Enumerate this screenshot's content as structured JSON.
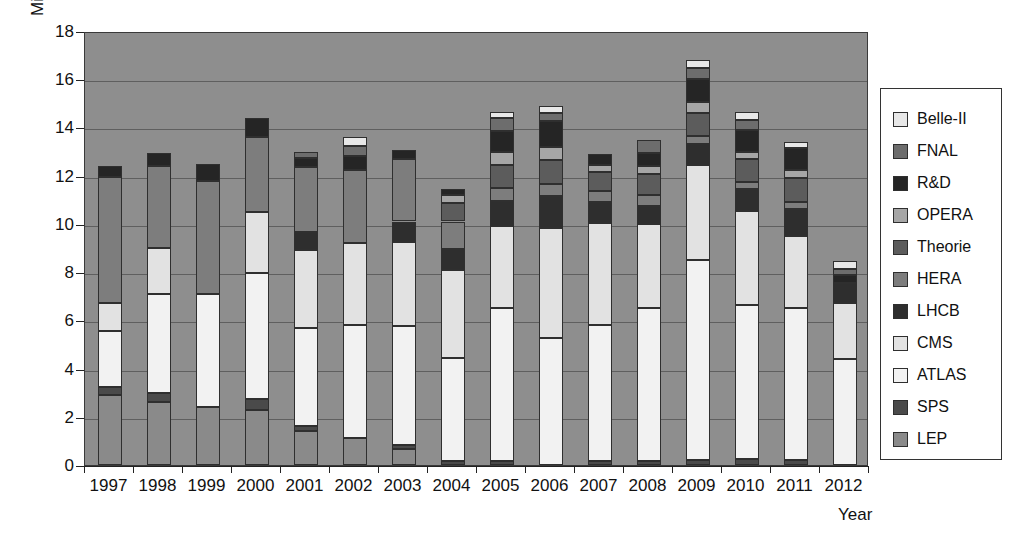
{
  "chart_data": {
    "type": "bar",
    "title": "",
    "subtitle": "",
    "stacked": true,
    "ylabel": "Mill. €",
    "xlabel": "Year",
    "ylim": [
      0,
      18
    ],
    "ytick_values": [
      0,
      2,
      4,
      6,
      8,
      10,
      12,
      14,
      16,
      18
    ],
    "ytick_labels": [
      "0",
      "2",
      "4",
      "6",
      "8",
      "10",
      "12",
      "14",
      "16",
      "18"
    ],
    "grid": true,
    "grid_axis": "y",
    "legend_position": "right",
    "categories": [
      "1997",
      "1998",
      "1999",
      "2000",
      "2001",
      "2002",
      "2003",
      "2004",
      "2005",
      "2006",
      "2007",
      "2008",
      "2009",
      "2010",
      "2011",
      "2012"
    ],
    "series": [
      {
        "name": "LEP",
        "color": "#8a8a8a",
        "values": [
          2.9,
          2.6,
          2.4,
          2.3,
          1.4,
          1.1,
          0.65,
          0.0,
          0.0,
          0.0,
          0.0,
          0.0,
          0.0,
          0.0,
          0.0,
          0.0
        ]
      },
      {
        "name": "SPS",
        "color": "#4a4a4a",
        "values": [
          0.35,
          0.4,
          0.0,
          0.45,
          0.2,
          0.0,
          0.2,
          0.15,
          0.15,
          0.0,
          0.15,
          0.15,
          0.2,
          0.25,
          0.2,
          0.0
        ]
      },
      {
        "name": "ATLAS",
        "color": "#f2f2f2",
        "values": [
          2.3,
          4.1,
          4.7,
          5.2,
          4.1,
          4.7,
          4.9,
          4.3,
          6.35,
          5.25,
          5.65,
          6.35,
          8.3,
          6.4,
          6.3,
          4.4
        ]
      },
      {
        "name": "CMS",
        "color": "#e2e2e2",
        "values": [
          1.15,
          1.9,
          0.0,
          2.55,
          3.2,
          3.4,
          3.5,
          3.65,
          3.4,
          4.6,
          4.25,
          3.5,
          3.95,
          3.9,
          3.0,
          2.3
        ]
      },
      {
        "name": "LHCB",
        "color": "#2e2e2e",
        "values": [
          0.0,
          0.0,
          0.0,
          0.0,
          0.75,
          0.0,
          0.85,
          0.85,
          1.05,
          1.3,
          0.85,
          0.75,
          0.85,
          0.9,
          1.1,
          0.85
        ]
      },
      {
        "name": "HERA",
        "color": "#7d7d7d",
        "values": [
          5.25,
          3.4,
          4.7,
          3.1,
          2.7,
          3.05,
          2.6,
          1.15,
          0.55,
          0.5,
          0.45,
          0.45,
          0.35,
          0.3,
          0.3,
          0.0
        ]
      },
      {
        "name": "Theorie",
        "color": "#5c5c5c",
        "values": [
          0.0,
          0.0,
          0.0,
          0.0,
          0.0,
          0.0,
          0.0,
          0.75,
          0.95,
          1.0,
          0.8,
          0.85,
          0.95,
          0.95,
          1.0,
          0.0
        ]
      },
      {
        "name": "OPERA",
        "color": "#a6a6a6",
        "values": [
          0.0,
          0.0,
          0.0,
          0.0,
          0.0,
          0.0,
          0.0,
          0.35,
          0.55,
          0.55,
          0.3,
          0.35,
          0.45,
          0.3,
          0.35,
          0.0
        ]
      },
      {
        "name": "R&D",
        "color": "#252525",
        "values": [
          0.45,
          0.55,
          0.7,
          0.8,
          0.4,
          0.55,
          0.35,
          0.25,
          0.85,
          1.05,
          0.45,
          0.55,
          0.95,
          0.9,
          0.9,
          0.35
        ]
      },
      {
        "name": "FNAL",
        "color": "#6d6d6d",
        "values": [
          0.0,
          0.0,
          0.0,
          0.0,
          0.25,
          0.45,
          0.0,
          0.0,
          0.55,
          0.35,
          0.0,
          0.55,
          0.45,
          0.4,
          0.0,
          0.25
        ]
      },
      {
        "name": "Belle-II",
        "color": "#e8e8e8",
        "values": [
          0.0,
          0.0,
          0.0,
          0.0,
          0.0,
          0.35,
          0.0,
          0.0,
          0.25,
          0.3,
          0.0,
          0.0,
          0.35,
          0.35,
          0.25,
          0.3
        ]
      }
    ],
    "totals": [
      12.4,
      12.95,
      12.5,
      14.4,
      13.0,
      13.6,
      13.05,
      11.45,
      14.65,
      14.9,
      12.9,
      13.5,
      16.75,
      14.65,
      13.4,
      8.45
    ]
  },
  "legend": {
    "items": [
      {
        "label": "Belle-II",
        "color": "#e8e8e8"
      },
      {
        "label": "FNAL",
        "color": "#6d6d6d"
      },
      {
        "label": "R&D",
        "color": "#252525"
      },
      {
        "label": "OPERA",
        "color": "#a6a6a6"
      },
      {
        "label": "Theorie",
        "color": "#5c5c5c"
      },
      {
        "label": "HERA",
        "color": "#7d7d7d"
      },
      {
        "label": "LHCB",
        "color": "#2e2e2e"
      },
      {
        "label": "CMS",
        "color": "#e2e2e2"
      },
      {
        "label": "ATLAS",
        "color": "#f2f2f2"
      },
      {
        "label": "SPS",
        "color": "#4a4a4a"
      },
      {
        "label": "LEP",
        "color": "#8a8a8a"
      }
    ]
  },
  "colors": {
    "plot_background": "#8e8e8e",
    "gridline": "#5f5f5f",
    "axis": "#222222",
    "page_background": "#ffffff",
    "text": "#111111"
  }
}
